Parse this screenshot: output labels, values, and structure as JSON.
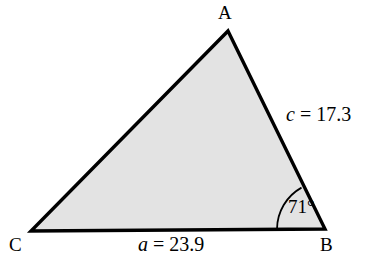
{
  "figure": {
    "kind": "triangle-diagram",
    "background_color": "#ffffff",
    "fill_color": "#e3e3e3",
    "stroke_color": "#000000",
    "vertices": {
      "A": {
        "label": "A",
        "x": 228,
        "y": 31
      },
      "B": {
        "label": "B",
        "x": 325,
        "y": 229
      },
      "C": {
        "label": "C",
        "x": 31,
        "y": 231
      }
    },
    "sides": [
      {
        "name": "a",
        "variable": "a",
        "equals": "=",
        "value": "23.9",
        "text": "a = 23.9",
        "between": "C-B"
      },
      {
        "name": "c",
        "variable": "c",
        "equals": "=",
        "value": "17.3",
        "text": "c = 17.3",
        "between": "A-B"
      }
    ],
    "angles": [
      {
        "at_vertex": "B",
        "value": "71",
        "unit": "°",
        "text": "71°",
        "arc_radius": 48
      }
    ]
  }
}
